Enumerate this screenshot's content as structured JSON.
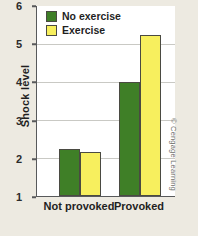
{
  "chart_data": {
    "type": "bar",
    "title": "",
    "xlabel": "",
    "ylabel": "Shock level",
    "categories": [
      "Not provoked",
      "Provoked"
    ],
    "series": [
      {
        "name": "No exercise",
        "color": "#3f7f27",
        "values": [
          2.25,
          4.0
        ]
      },
      {
        "name": "Exercise",
        "color": "#f7ef5e",
        "values": [
          2.15,
          5.25
        ]
      }
    ],
    "ylim": [
      1,
      6
    ],
    "yticks": [
      1,
      2,
      3,
      4,
      5,
      6
    ],
    "ytick_labels": [
      "1",
      "2",
      "3",
      "4",
      "5",
      "6"
    ],
    "grid": true,
    "legend_position": "top-left"
  },
  "legend": {
    "items": [
      {
        "label": "No exercise",
        "swatch": "green-swatch"
      },
      {
        "label": "Exercise",
        "swatch": "yellow-swatch"
      }
    ]
  },
  "axis": {
    "y_title": "Shock level",
    "y_ticks": [
      "6",
      "5",
      "4",
      "3",
      "2",
      "1"
    ],
    "x_ticks": [
      "Not provoked",
      "Provoked"
    ]
  },
  "credit": {
    "text": "© Cengage Learning"
  },
  "colors": {
    "green": "#3f7f27",
    "yellow": "#f7ef5e",
    "page_background": "#edeae1",
    "plot_background": "#ffffff",
    "axis": "#58595b",
    "gridline": "#c9c9c4"
  }
}
